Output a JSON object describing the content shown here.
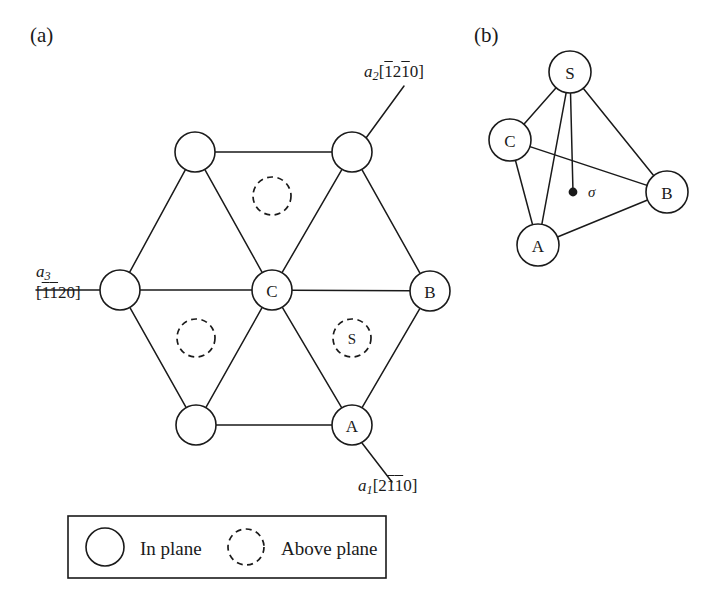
{
  "figure": {
    "panel_a_label": "(a)",
    "panel_b_label": "(b)"
  },
  "panel_a": {
    "axes": [
      {
        "id": "a2",
        "vector": "a",
        "subscript": "2",
        "index_open": "[",
        "index_digits": [
          {
            "d": "1",
            "bar": true
          },
          {
            "d": "2",
            "bar": false
          },
          {
            "d": "1",
            "bar": true
          },
          {
            "d": "0",
            "bar": false
          }
        ],
        "index_close": "]",
        "plain": "a2[1̄21̄0]"
      },
      {
        "id": "a3",
        "vector": "a",
        "subscript": "3",
        "index_open": "[",
        "index_digits": [
          {
            "d": "1",
            "bar": true
          },
          {
            "d": "1",
            "bar": true
          },
          {
            "d": "2",
            "bar": false
          },
          {
            "d": "0",
            "bar": false
          }
        ],
        "index_close": "]",
        "plain": "a3[1̄1̄20]"
      },
      {
        "id": "a1",
        "vector": "a",
        "subscript": "1",
        "index_open": "[",
        "index_digits": [
          {
            "d": "2",
            "bar": false
          },
          {
            "d": "1",
            "bar": true
          },
          {
            "d": "1",
            "bar": true
          },
          {
            "d": "0",
            "bar": false
          }
        ],
        "index_close": "]",
        "plain": "a1[21̄1̄0]"
      }
    ],
    "in_plane_atoms": [
      {
        "id": "top-left",
        "label": "",
        "cx": 195,
        "cy": 152,
        "r": 20
      },
      {
        "id": "top-right",
        "label": "",
        "cx": 352,
        "cy": 152,
        "r": 20
      },
      {
        "id": "left",
        "label": "",
        "cx": 120,
        "cy": 290,
        "r": 20
      },
      {
        "id": "center-c",
        "label": "C",
        "cx": 272,
        "cy": 290,
        "r": 20
      },
      {
        "id": "right-b",
        "label": "B",
        "cx": 430,
        "cy": 291,
        "r": 20
      },
      {
        "id": "bottom-left",
        "label": "",
        "cx": 196,
        "cy": 425,
        "r": 20
      },
      {
        "id": "bottom-right-a",
        "label": "A",
        "cx": 352,
        "cy": 425,
        "r": 20
      }
    ],
    "above_plane_atoms": [
      {
        "id": "upper-void",
        "label": "",
        "cx": 272,
        "cy": 196,
        "r": 19
      },
      {
        "id": "left-void",
        "label": "",
        "cx": 196,
        "cy": 338,
        "r": 19
      },
      {
        "id": "s-site",
        "label": "S",
        "cx": 352,
        "cy": 338,
        "r": 19
      }
    ],
    "bonds": [
      {
        "from": "top-left",
        "to": "top-right"
      },
      {
        "from": "top-left",
        "to": "left"
      },
      {
        "from": "top-left",
        "to": "center-c"
      },
      {
        "from": "top-right",
        "to": "center-c"
      },
      {
        "from": "top-right",
        "to": "right-b"
      },
      {
        "from": "left",
        "to": "center-c"
      },
      {
        "from": "left",
        "to": "bottom-left"
      },
      {
        "from": "center-c",
        "to": "right-b"
      },
      {
        "from": "center-c",
        "to": "bottom-left"
      },
      {
        "from": "center-c",
        "to": "bottom-right-a"
      },
      {
        "from": "bottom-left",
        "to": "bottom-right-a"
      },
      {
        "from": "bottom-right-a",
        "to": "right-b"
      }
    ]
  },
  "panel_b": {
    "nodes": [
      {
        "id": "S",
        "label": "S",
        "cx": 570,
        "cy": 72,
        "r": 21
      },
      {
        "id": "C",
        "label": "C",
        "cx": 510,
        "cy": 140,
        "r": 21
      },
      {
        "id": "B",
        "label": "B",
        "cx": 667,
        "cy": 192,
        "r": 21
      },
      {
        "id": "A",
        "label": "A",
        "cx": 538,
        "cy": 245,
        "r": 21
      }
    ],
    "edges": [
      {
        "from": "S",
        "to": "C"
      },
      {
        "from": "S",
        "to": "B"
      },
      {
        "from": "S",
        "to": "A"
      },
      {
        "from": "C",
        "to": "A"
      },
      {
        "from": "C",
        "to": "B"
      },
      {
        "from": "A",
        "to": "B"
      }
    ],
    "sigma": {
      "label": "σ",
      "dot_x": 573,
      "dot_y": 192,
      "dot_r": 4.4,
      "label_x": 588,
      "label_y": 192,
      "stem_from": "S"
    }
  },
  "legend": {
    "box": {
      "x": 68,
      "y": 516,
      "width": 318,
      "height": 62
    },
    "entries": [
      {
        "id": "in-plane",
        "label": "In plane",
        "marker": "solid-circle",
        "marker_cx": 105,
        "marker_cy": 547,
        "marker_r": 19,
        "text_x": 140,
        "text_y": 548
      },
      {
        "id": "above-plane",
        "label": "Above plane",
        "marker": "dashed-circle",
        "marker_cx": 246,
        "marker_cy": 547,
        "marker_r": 18,
        "text_x": 281,
        "text_y": 548
      }
    ]
  }
}
